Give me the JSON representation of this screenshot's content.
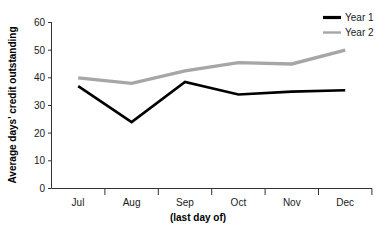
{
  "chart_data": {
    "type": "line",
    "title": "",
    "xlabel": "(last day of)",
    "ylabel": "Average days' credit outstanding",
    "categories": [
      "Jul",
      "Aug",
      "Sep",
      "Oct",
      "Nov",
      "Dec"
    ],
    "series": [
      {
        "name": "Year 1",
        "color": "#000000",
        "values": [
          37,
          24,
          38.5,
          34,
          35,
          35.5
        ]
      },
      {
        "name": "Year 2",
        "color": "#a6a6a6",
        "values": [
          40,
          38,
          42.5,
          45.5,
          45,
          50
        ]
      }
    ],
    "ylim": [
      0,
      60
    ],
    "yticks": [
      0,
      10,
      20,
      30,
      40,
      50,
      60
    ],
    "ytick_labels": [
      "0",
      "10",
      "20",
      "30",
      "40",
      "50",
      "60"
    ],
    "grid": false,
    "legend_position": "top-right"
  },
  "axis": {
    "y_title": "Average days' credit outstanding",
    "x_title": "(last day of)",
    "y_ticks": [
      "60",
      "50",
      "40",
      "30",
      "20",
      "10",
      "0"
    ],
    "x_ticks": [
      "Jul",
      "Aug",
      "Sep",
      "Oct",
      "Nov",
      "Dec"
    ]
  },
  "legend": {
    "entries": [
      {
        "label": "Year 1",
        "color": "#000000"
      },
      {
        "label": "Year 2",
        "color": "#a6a6a6"
      }
    ]
  }
}
